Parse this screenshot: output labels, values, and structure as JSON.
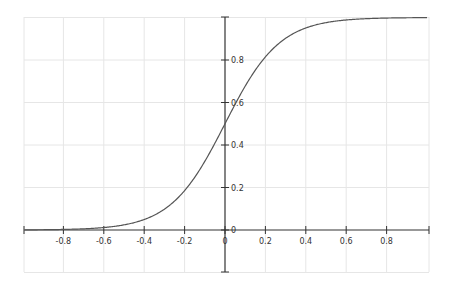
{
  "chart_data": {
    "type": "line",
    "title": "",
    "xlabel": "",
    "ylabel": "",
    "function": "1/(1+exp(-7.4*x))",
    "xlim": [
      -1.0,
      1.0
    ],
    "ylim": [
      -0.2,
      1.0
    ],
    "grid": true,
    "x_ticks": [
      "-0.8",
      "-0.6",
      "-0.4",
      "-0.2",
      "0",
      "0.2",
      "0.4",
      "0.6",
      "0.8"
    ],
    "y_ticks": [
      "0",
      "0.2",
      "0.4",
      "0.6",
      "0.8"
    ],
    "origin_label": "0",
    "series": [
      {
        "name": "sigmoid",
        "color": "#555555",
        "x": [
          -1.0,
          -0.9,
          -0.8,
          -0.7,
          -0.6,
          -0.5,
          -0.4,
          -0.3,
          -0.2,
          -0.1,
          0.0,
          0.1,
          0.2,
          0.3,
          0.4,
          0.5,
          0.6,
          0.7,
          0.8,
          0.9,
          1.0
        ],
        "y": [
          0.0006,
          0.0013,
          0.0027,
          0.0056,
          0.0117,
          0.0242,
          0.0493,
          0.098,
          0.1854,
          0.3231,
          0.5,
          0.6769,
          0.8146,
          0.902,
          0.9507,
          0.9758,
          0.9883,
          0.9944,
          0.9973,
          0.9987,
          0.9994
        ]
      }
    ]
  },
  "colors": {
    "axis": "#333333",
    "grid": "#e6e6e6",
    "curve": "#555555"
  }
}
